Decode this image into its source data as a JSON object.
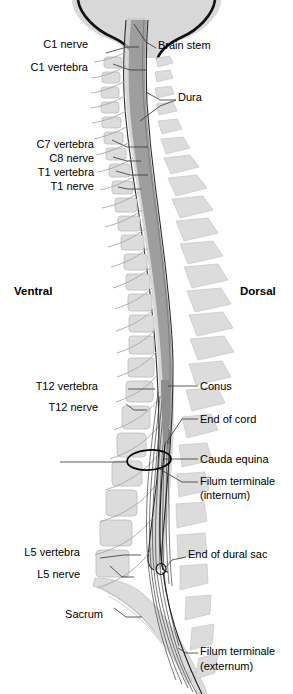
{
  "figure": {
    "orientation": {
      "ventral": "Ventral",
      "dorsal": "Dorsal"
    },
    "colors": {
      "bone": "#dcdcdc",
      "bone_stroke": "#b4b4b4",
      "cord": "#9e9e9e",
      "cord_stroke": "#6e6e6e",
      "dura_fill": "#c4c4c4",
      "outline": "#1a1a1a",
      "leader": "#333333",
      "background": "#ffffff"
    }
  },
  "labels": {
    "left": [
      {
        "id": "c1-nerve",
        "text": "C1 nerve",
        "x": 88,
        "y": 44
      },
      {
        "id": "c1-vertebra",
        "text": "C1 vertebra",
        "x": 88,
        "y": 67
      },
      {
        "id": "c7-vertebra",
        "text": "C7 vertebra",
        "x": 94,
        "y": 144
      },
      {
        "id": "c8-nerve",
        "text": "C8 nerve",
        "x": 94,
        "y": 158
      },
      {
        "id": "t1-vertebra",
        "text": "T1 vertebra",
        "x": 94,
        "y": 172
      },
      {
        "id": "t1-nerve",
        "text": "T1 nerve",
        "x": 94,
        "y": 186
      },
      {
        "id": "t12-vertebra",
        "text": "T12 vertebra",
        "x": 98,
        "y": 386
      },
      {
        "id": "t12-nerve",
        "text": "T12 nerve",
        "x": 98,
        "y": 407
      },
      {
        "id": "l5-vertebra",
        "text": "L5 vertebra",
        "x": 80,
        "y": 552
      },
      {
        "id": "l5-nerve",
        "text": "L5 nerve",
        "x": 80,
        "y": 574
      },
      {
        "id": "sacrum",
        "text": "Sacrum",
        "x": 103,
        "y": 614
      }
    ],
    "right": [
      {
        "id": "brain-stem",
        "text": "Brain stem",
        "x": 158,
        "y": 45
      },
      {
        "id": "dura",
        "text": "Dura",
        "x": 178,
        "y": 97
      },
      {
        "id": "conus",
        "text": "Conus",
        "x": 200,
        "y": 383
      },
      {
        "id": "end-of-cord",
        "text": "End of cord",
        "x": 200,
        "y": 416
      },
      {
        "id": "cauda-equina",
        "text": "Cauda equina",
        "x": 200,
        "y": 456
      },
      {
        "id": "filum-internum-1",
        "text": "Filum terminale",
        "x": 200,
        "y": 478
      },
      {
        "id": "filum-internum-2",
        "text": "(internum)",
        "x": 200,
        "y": 492
      },
      {
        "id": "end-of-dural-sac",
        "text": "End of dural sac",
        "x": 188,
        "y": 554
      },
      {
        "id": "filum-externum-1",
        "text": "Filum terminale",
        "x": 200,
        "y": 650
      },
      {
        "id": "filum-externum-2",
        "text": "(externum)",
        "x": 200,
        "y": 665
      }
    ]
  }
}
